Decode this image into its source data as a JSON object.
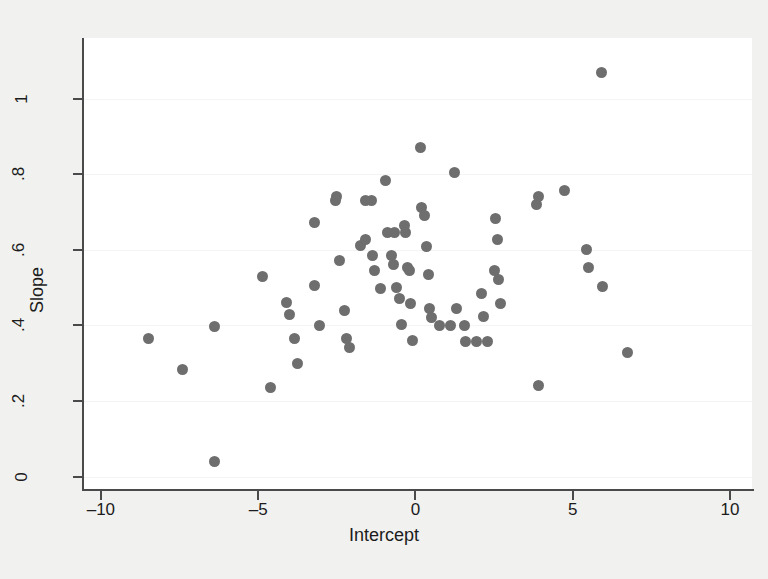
{
  "chart_data": {
    "type": "scatter",
    "title": "",
    "xlabel": "Intercept",
    "ylabel": "Slope",
    "xlim": [
      -10.6,
      10.7
    ],
    "ylim": [
      -0.035,
      1.16
    ],
    "xticks": [
      -10,
      -5,
      0,
      5,
      10
    ],
    "xticklabels": [
      "-10",
      "-5",
      "0",
      "5",
      "10"
    ],
    "yticks": [
      0,
      0.2,
      0.4,
      0.6,
      0.8,
      1
    ],
    "yticklabels": [
      "0",
      ".2",
      ".4",
      ".6",
      ".8",
      "1"
    ],
    "grid": "horizontal",
    "marker": {
      "shape": "circle",
      "color": "#6e6e6e",
      "size": 11
    },
    "background": "#ffffff",
    "figure_background": "#f1f1ef",
    "n_points": 68,
    "points": [
      {
        "x": -8.5,
        "y": 0.365
      },
      {
        "x": -7.4,
        "y": 0.283
      },
      {
        "x": -6.4,
        "y": 0.396
      },
      {
        "x": -6.4,
        "y": 0.04
      },
      {
        "x": -4.85,
        "y": 0.53
      },
      {
        "x": -4.6,
        "y": 0.235
      },
      {
        "x": -4.1,
        "y": 0.46
      },
      {
        "x": -4.0,
        "y": 0.429
      },
      {
        "x": -3.85,
        "y": 0.365
      },
      {
        "x": -3.75,
        "y": 0.3
      },
      {
        "x": -3.2,
        "y": 0.672
      },
      {
        "x": -3.2,
        "y": 0.506
      },
      {
        "x": -3.05,
        "y": 0.4
      },
      {
        "x": -2.55,
        "y": 0.73
      },
      {
        "x": -2.5,
        "y": 0.74
      },
      {
        "x": -2.4,
        "y": 0.572
      },
      {
        "x": -2.25,
        "y": 0.44
      },
      {
        "x": -2.2,
        "y": 0.365
      },
      {
        "x": -2.1,
        "y": 0.342
      },
      {
        "x": -1.75,
        "y": 0.612
      },
      {
        "x": -1.6,
        "y": 0.628
      },
      {
        "x": -1.6,
        "y": 0.73
      },
      {
        "x": -1.4,
        "y": 0.73
      },
      {
        "x": -1.35,
        "y": 0.586
      },
      {
        "x": -1.3,
        "y": 0.546
      },
      {
        "x": -1.1,
        "y": 0.497
      },
      {
        "x": -0.95,
        "y": 0.783
      },
      {
        "x": -0.9,
        "y": 0.646
      },
      {
        "x": -0.75,
        "y": 0.585
      },
      {
        "x": -0.7,
        "y": 0.56
      },
      {
        "x": -0.65,
        "y": 0.646
      },
      {
        "x": -0.6,
        "y": 0.5
      },
      {
        "x": -0.5,
        "y": 0.472
      },
      {
        "x": -0.45,
        "y": 0.403
      },
      {
        "x": -0.35,
        "y": 0.664
      },
      {
        "x": -0.3,
        "y": 0.645
      },
      {
        "x": -0.25,
        "y": 0.552
      },
      {
        "x": -0.2,
        "y": 0.546
      },
      {
        "x": -0.15,
        "y": 0.458
      },
      {
        "x": -0.1,
        "y": 0.36
      },
      {
        "x": 0.15,
        "y": 0.87
      },
      {
        "x": 0.2,
        "y": 0.712
      },
      {
        "x": 0.3,
        "y": 0.69
      },
      {
        "x": 0.35,
        "y": 0.61
      },
      {
        "x": 0.4,
        "y": 0.535
      },
      {
        "x": 0.45,
        "y": 0.446
      },
      {
        "x": 0.5,
        "y": 0.422
      },
      {
        "x": 0.75,
        "y": 0.4
      },
      {
        "x": 1.1,
        "y": 0.4
      },
      {
        "x": 1.25,
        "y": 0.805
      },
      {
        "x": 1.3,
        "y": 0.445
      },
      {
        "x": 1.55,
        "y": 0.4
      },
      {
        "x": 1.6,
        "y": 0.358
      },
      {
        "x": 1.95,
        "y": 0.358
      },
      {
        "x": 2.1,
        "y": 0.485
      },
      {
        "x": 2.15,
        "y": 0.425
      },
      {
        "x": 2.3,
        "y": 0.358
      },
      {
        "x": 2.5,
        "y": 0.545
      },
      {
        "x": 2.55,
        "y": 0.682
      },
      {
        "x": 2.6,
        "y": 0.628
      },
      {
        "x": 2.65,
        "y": 0.522
      },
      {
        "x": 2.7,
        "y": 0.458
      },
      {
        "x": 3.9,
        "y": 0.24
      },
      {
        "x": 3.85,
        "y": 0.72
      },
      {
        "x": 3.9,
        "y": 0.742
      },
      {
        "x": 4.75,
        "y": 0.758
      },
      {
        "x": 5.45,
        "y": 0.6
      },
      {
        "x": 5.5,
        "y": 0.552
      },
      {
        "x": 5.95,
        "y": 0.504
      },
      {
        "x": 5.9,
        "y": 1.07
      },
      {
        "x": 6.75,
        "y": 0.328
      }
    ]
  }
}
